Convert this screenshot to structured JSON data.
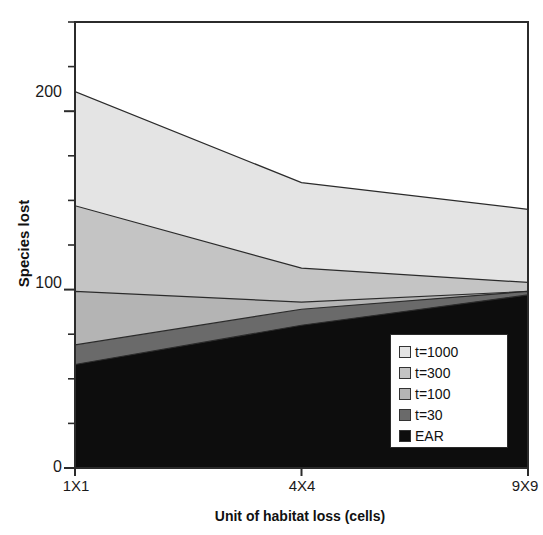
{
  "chart_data": {
    "type": "area",
    "title": "",
    "subtitle": "",
    "xlabel": "Unit of habitat loss (cells)",
    "ylabel": "Species lost",
    "stacked": true,
    "categories": [
      "1X1",
      "4X4",
      "9X9"
    ],
    "x_tick_labels": [
      "1X1",
      "4X4",
      "9X9"
    ],
    "y_tick_labels": [
      "0",
      "100",
      "200"
    ],
    "y_major_ticks": [
      0,
      100,
      200
    ],
    "y_minor_tick_interval": 25,
    "ylim": [
      0,
      250
    ],
    "xlim": [
      0,
      2
    ],
    "grid": false,
    "legend_position": "bottom-right",
    "series": [
      {
        "name": "EAR",
        "color": "#0d0d0d",
        "legend_label": "EAR",
        "values": [
          58,
          80,
          97
        ]
      },
      {
        "name": "t=30",
        "color": "#6a6a6a",
        "legend_label": "t=30",
        "values": [
          11,
          9,
          2
        ]
      },
      {
        "name": "t=100",
        "color": "#b4b4b4",
        "legend_label": "t=100",
        "values": [
          30,
          4,
          0
        ]
      },
      {
        "name": "t=300",
        "color": "#c4c4c4",
        "legend_label": "t=300",
        "values": [
          48,
          19,
          5
        ]
      },
      {
        "name": "t=1000",
        "color": "#e4e4e4",
        "legend_label": "t=1000",
        "values": [
          64,
          48,
          41
        ]
      }
    ],
    "cumulative_tops": {
      "EAR": [
        58,
        80,
        97
      ],
      "t=30": [
        69,
        89,
        99
      ],
      "t=100": [
        99,
        93,
        99
      ],
      "t=300": [
        147,
        112,
        104
      ],
      "t=1000": [
        211,
        160,
        145
      ]
    },
    "annotations": []
  },
  "axes": {
    "y_title": "Species lost",
    "x_title": "Unit of habitat loss (cells)",
    "y_labels": [
      "200",
      "100",
      "0"
    ],
    "x_labels": [
      "1X1",
      "4X4",
      "9X9"
    ]
  },
  "legend": {
    "items": [
      {
        "label": "t=1000",
        "color": "#e4e4e4"
      },
      {
        "label": "t=300",
        "color": "#c4c4c4"
      },
      {
        "label": "t=100",
        "color": "#b4b4b4"
      },
      {
        "label": "t=30",
        "color": "#6a6a6a"
      },
      {
        "label": "EAR",
        "color": "#0d0d0d"
      }
    ]
  }
}
